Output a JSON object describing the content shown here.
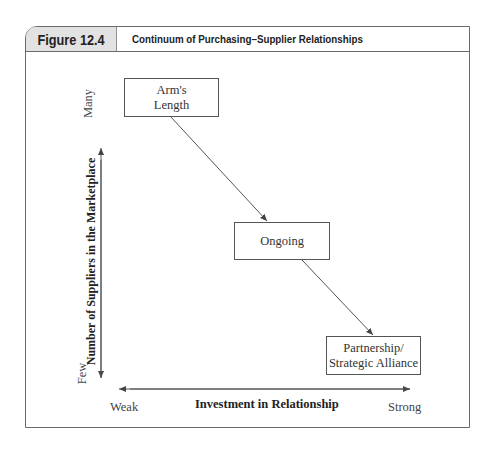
{
  "figure": {
    "number": "Figure 12.4",
    "title": "Continuum of Purchasing–Supplier Relationships"
  },
  "axes": {
    "y_label": "Number of Suppliers in the Marketplace",
    "y_high": "Many",
    "y_low": "Few",
    "x_label": "Investment in Relationship",
    "x_low": "Weak",
    "x_high": "Strong"
  },
  "nodes": [
    {
      "label_line1": "Arm's",
      "label_line2": "Length"
    },
    {
      "label_line1": "Ongoing",
      "label_line2": ""
    },
    {
      "label_line1": "Partnership/",
      "label_line2": "Strategic Alliance"
    }
  ],
  "colors": {
    "line": "#555555",
    "tab_bg": "#e2e2e2",
    "border": "#6a6a6a"
  }
}
